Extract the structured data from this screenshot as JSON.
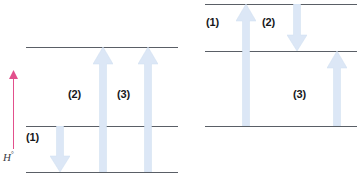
{
  "figure": {
    "title": "",
    "background_color": "#ffffff",
    "arrow_color": "#dce7f6",
    "arrow_edge_color": "#cbdcf0",
    "level_line_color": "#5a5f66",
    "axis_color": "#e2508c",
    "label_color": "#16181c"
  },
  "axis": {
    "label": "H",
    "label_superscript": "°",
    "direction": "up"
  },
  "panels": [
    {
      "id": "left-panel",
      "name": "one-step-mechanism",
      "levels": [
        {
          "id": "left-top-level",
          "y": 47,
          "x": 26,
          "width": 152
        },
        {
          "id": "left-middle-level",
          "y": 126,
          "x": 26,
          "width": 152
        },
        {
          "id": "left-bottom-level",
          "y": 172,
          "x": 26,
          "width": 152
        }
      ],
      "arrows": [
        {
          "id": "left-arrow-1",
          "label": "(1)",
          "direction": "down",
          "x": 50,
          "y_start": 126,
          "y_end": 172,
          "width": 20
        },
        {
          "id": "left-arrow-2",
          "label": "(2)",
          "direction": "up",
          "x": 93,
          "y_start": 172,
          "y_end": 47,
          "width": 20
        },
        {
          "id": "left-arrow-3",
          "label": "(3)",
          "direction": "up",
          "x": 138,
          "y_start": 172,
          "y_end": 47,
          "width": 20
        }
      ],
      "labels": [
        {
          "id": "left-label-1",
          "text": "(1)",
          "x": 26,
          "y": 131
        },
        {
          "id": "left-label-2",
          "text": "(2)",
          "x": 68,
          "y": 88
        },
        {
          "id": "left-label-3",
          "text": "(3)",
          "x": 117,
          "y": 88
        }
      ]
    },
    {
      "id": "right-panel",
      "name": "two-step-mechanism",
      "levels": [
        {
          "id": "right-top-level",
          "y": 4,
          "x": 205,
          "width": 152
        },
        {
          "id": "right-middle-level",
          "y": 51,
          "x": 205,
          "width": 152
        },
        {
          "id": "right-bottom-level",
          "y": 126,
          "x": 205,
          "width": 152
        }
      ],
      "arrows": [
        {
          "id": "right-arrow-1",
          "label": "(1)",
          "direction": "up",
          "x": 236,
          "y_start": 126,
          "y_end": 4,
          "width": 20
        },
        {
          "id": "right-arrow-2",
          "label": "(2)",
          "direction": "down",
          "x": 287,
          "y_start": 4,
          "y_end": 51,
          "width": 20
        },
        {
          "id": "right-arrow-3",
          "label": "(3)",
          "direction": "up",
          "x": 327,
          "y_start": 126,
          "y_end": 51,
          "width": 20
        }
      ],
      "labels": [
        {
          "id": "right-label-1",
          "text": "(1)",
          "x": 206,
          "y": 16
        },
        {
          "id": "right-label-2",
          "text": "(2)",
          "x": 262,
          "y": 16
        },
        {
          "id": "right-label-3",
          "text": "(3)",
          "x": 293,
          "y": 88
        }
      ]
    }
  ]
}
